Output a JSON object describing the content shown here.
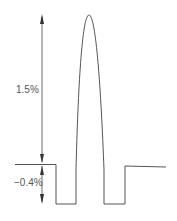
{
  "diagram": {
    "type": "pulse waveform with dimension arrows",
    "colors": {
      "line": "#555555",
      "arrow": "#333333",
      "background": "#ffffff"
    },
    "annotations": [
      {
        "id": "positive",
        "label": "1.5%",
        "from_y": 15,
        "to_y": 164
      },
      {
        "id": "negative",
        "label": "−0.4%",
        "from_y": 164,
        "to_y": 203
      }
    ],
    "waveform_points": {
      "baseline_y": 164,
      "trough_y": 204,
      "peak": {
        "x": 89,
        "y": 15
      },
      "left_step_x": 56,
      "pulse_rise_x": 76,
      "pulse_fall_x": 104,
      "right_step_x": 125
    }
  }
}
